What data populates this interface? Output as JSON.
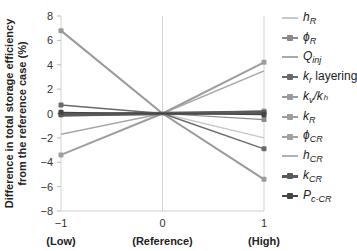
{
  "chart_data": {
    "type": "line",
    "title": "",
    "xlabel": "",
    "ylabel": "Difference in total storage efficiency from the reference case (%)",
    "ylabel_lines": [
      "Difference in total storage efficiency",
      "from the reference case (%)"
    ],
    "x": [
      -1,
      0,
      1
    ],
    "x_tick_labels": [
      "−1",
      "0",
      "1"
    ],
    "x_category_labels": [
      "(Low)",
      "(Reference)",
      "(High)"
    ],
    "y_ticks": [
      8,
      6,
      4,
      2,
      0,
      -2,
      -4,
      -6,
      -8
    ],
    "y_tick_labels": [
      "8",
      "6",
      "4",
      "2",
      "0",
      "−2",
      "−4",
      "−6",
      "−8"
    ],
    "ylim": [
      -8,
      8
    ],
    "xlim": [
      -1,
      1
    ],
    "grid": "vertical at x ticks",
    "legend_position": "right",
    "series": [
      {
        "name": "h_R",
        "label": "hR",
        "values": [
          0.0,
          0,
          -2.0
        ],
        "color": "#c8c8c8",
        "width": 1.5,
        "marker": false
      },
      {
        "name": "phi_R",
        "label": "φR",
        "values": [
          -0.1,
          0,
          -0.5
        ],
        "color": "#8a8a8a",
        "width": 1.2,
        "marker": true
      },
      {
        "name": "Q_inj",
        "label": "Qinj",
        "values": [
          -1.7,
          0,
          3.5
        ],
        "color": "#a8a8a8",
        "width": 1.5,
        "marker": false
      },
      {
        "name": "k_r layering",
        "label": "kr layering",
        "values": [
          0.7,
          0,
          -2.9
        ],
        "color": "#6a6a6a",
        "width": 1.5,
        "marker": true
      },
      {
        "name": "k_v/k_h",
        "label": "kv/kh",
        "values": [
          6.8,
          0,
          -5.4
        ],
        "color": "#9a9a9a",
        "width": 2,
        "marker": true
      },
      {
        "name": "k_R",
        "label": "kR",
        "values": [
          -3.4,
          0,
          4.2
        ],
        "color": "#9e9e9e",
        "width": 2,
        "marker": true
      },
      {
        "name": "phi_CR",
        "label": "φCR",
        "values": [
          0.0,
          0,
          0.2
        ],
        "color": "#a0a0a0",
        "width": 1.2,
        "marker": true
      },
      {
        "name": "h_CR",
        "label": "hCR",
        "values": [
          -0.2,
          0,
          0.2
        ],
        "color": "#b0b0b0",
        "width": 1.5,
        "marker": false
      },
      {
        "name": "k_CR",
        "label": "kCR",
        "values": [
          -0.1,
          0,
          0.1
        ],
        "color": "#5a5a5a",
        "width": 3.5,
        "marker": true
      },
      {
        "name": "P_c-CR",
        "label": "Pc-CR",
        "values": [
          0.1,
          0,
          -0.1
        ],
        "color": "#444444",
        "width": 1.2,
        "marker": true
      }
    ]
  },
  "legend": [
    {
      "main": "h",
      "sub": "R",
      "rest": "",
      "color": "#c8c8c8",
      "marker": false,
      "thick": false
    },
    {
      "main": "ϕ",
      "sub": "R",
      "rest": "",
      "color": "#8a8a8a",
      "marker": true,
      "thick": false
    },
    {
      "main": "Q",
      "sub": "inj",
      "rest": "",
      "color": "#a8a8a8",
      "marker": false,
      "thick": false
    },
    {
      "main": "k",
      "sub": "r",
      "rest": " layering",
      "color": "#6a6a6a",
      "marker": true,
      "thick": false
    },
    {
      "main": "k",
      "sub": "v",
      "rest": "/kₕ",
      "color": "#9a9a9a",
      "marker": true,
      "thick": false
    },
    {
      "main": "k",
      "sub": "R",
      "rest": "",
      "color": "#9e9e9e",
      "marker": true,
      "thick": false
    },
    {
      "main": "ϕ",
      "sub": "CR",
      "rest": "",
      "color": "#a0a0a0",
      "marker": true,
      "thick": false
    },
    {
      "main": "h",
      "sub": "CR",
      "rest": "",
      "color": "#b0b0b0",
      "marker": false,
      "thick": false
    },
    {
      "main": "k",
      "sub": "CR",
      "rest": "",
      "color": "#5a5a5a",
      "marker": true,
      "thick": true
    },
    {
      "main": "P",
      "sub": "c-CR",
      "rest": "",
      "color": "#444444",
      "marker": true,
      "thick": false
    }
  ]
}
